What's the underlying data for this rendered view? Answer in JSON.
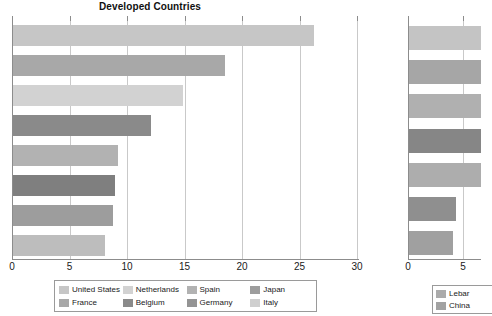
{
  "main": {
    "title": "Developed Countries",
    "axis": {
      "ticks": [
        0,
        5,
        10,
        15,
        20,
        25,
        30
      ],
      "tick_labels": [
        "0",
        "5",
        "10",
        "15",
        "20",
        "25",
        "30"
      ],
      "min": 0,
      "max": 30
    },
    "legend": {
      "items": [
        {
          "label": "United States",
          "color": "#c6c6c6"
        },
        {
          "label": "Netherlands",
          "color": "#d2d2d2"
        },
        {
          "label": "Spain",
          "color": "#b2b2b2"
        },
        {
          "label": "Japan",
          "color": "#9d9d9d"
        },
        {
          "label": "France",
          "color": "#a8a8a8"
        },
        {
          "label": "Belgium",
          "color": "#8a8a8a"
        },
        {
          "label": "Germany",
          "color": "#949494"
        },
        {
          "label": "Italy",
          "color": "#cfcfcf"
        }
      ]
    }
  },
  "second": {
    "axis": {
      "ticks": [
        0,
        5
      ],
      "tick_labels": [
        "0",
        "5"
      ],
      "min": 0,
      "max": 6.6
    },
    "legend": {
      "items": [
        {
          "label": "Lebar",
          "color": "#ababab"
        },
        {
          "label": "China",
          "color": "#a2a2a2"
        }
      ]
    }
  },
  "chart_data": [
    {
      "type": "bar",
      "orientation": "horizontal",
      "title": "Developed Countries",
      "xlabel": "",
      "ylabel": "",
      "xlim": [
        0,
        30
      ],
      "grid": true,
      "legend_position": "bottom",
      "categories": [
        "United States",
        "France",
        "Netherlands",
        "Belgium",
        "Spain",
        "Germany",
        "Japan",
        "Italy"
      ],
      "values": [
        26.2,
        18.4,
        14.8,
        12.0,
        9.1,
        8.9,
        8.7,
        8.0
      ],
      "colors": [
        "#c6c6c6",
        "#a8a8a8",
        "#d2d2d2",
        "#8a8a8a",
        "#b2b2b2",
        "#7f7f7f",
        "#9d9d9d",
        "#bdbdbd"
      ]
    },
    {
      "type": "bar",
      "orientation": "horizontal",
      "title": "",
      "xlabel": "",
      "ylabel": "",
      "xlim": [
        0,
        6.6
      ],
      "grid": true,
      "legend_position": "bottom",
      "note": "chart is clipped at right edge of screenshot",
      "categories": [
        "bar-1",
        "bar-2",
        "bar-3",
        "bar-4",
        "bar-5",
        "bar-6",
        "bar-7"
      ],
      "values": [
        6.6,
        6.6,
        6.6,
        6.6,
        6.6,
        4.3,
        4.0
      ],
      "colors": [
        "#c4c4c4",
        "#a6a6a6",
        "#b0b0b0",
        "#868686",
        "#adadad",
        "#8f8f8f",
        "#a0a0a0"
      ]
    }
  ]
}
